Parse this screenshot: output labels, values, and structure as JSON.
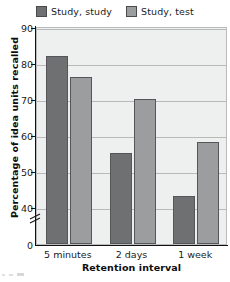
{
  "figure": {
    "legend": {
      "position": "top-center",
      "entries": [
        {
          "label": "Study, study",
          "color": "#6e7072",
          "icon": "legend-swatch"
        },
        {
          "label": "Study, test",
          "color": "#9b9d9e",
          "icon": "legend-swatch"
        }
      ]
    },
    "axis_break_symbol": "zigzag-break"
  },
  "chart_data": {
    "type": "bar",
    "title": "",
    "xlabel": "Retention interval",
    "ylabel": "Percentage of idea units recalled",
    "categories": [
      "5 minutes",
      "2 days",
      "1 week"
    ],
    "series": [
      {
        "name": "Study, study",
        "color": "#6e7072",
        "values": [
          82,
          55,
          43
        ]
      },
      {
        "name": "Study, test",
        "color": "#9b9d9e",
        "values": [
          76,
          70,
          58
        ]
      }
    ],
    "ylim": [
      40,
      90
    ],
    "y_axis_origin_label": "0",
    "yticks": [
      40,
      50,
      60,
      70,
      80,
      90
    ],
    "ytick_labels": [
      "40",
      "50",
      "60",
      "70",
      "80",
      "90"
    ],
    "grid": true,
    "grid_axis": "y",
    "legend_position": "top-center",
    "axis_break": true,
    "plot_background": "#eef0ef"
  }
}
